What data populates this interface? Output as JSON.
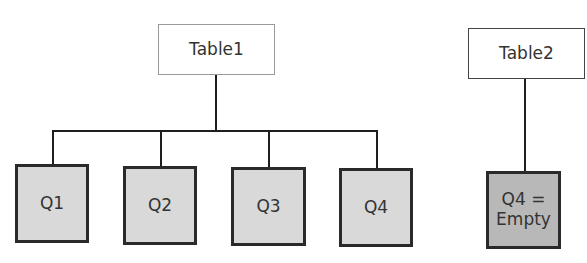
{
  "diagram": {
    "table1": {
      "label": "Table1",
      "children": [
        {
          "label": "Q1"
        },
        {
          "label": "Q2"
        },
        {
          "label": "Q3"
        },
        {
          "label": "Q4"
        }
      ]
    },
    "table2": {
      "label": "Table2",
      "children": [
        {
          "label_line1": "Q4 =",
          "label_line2": "Empty"
        }
      ]
    }
  },
  "colors": {
    "quarter_fill": "#d9d9d9",
    "empty_fill": "#b8b8b8",
    "border": "#2a2a2a",
    "table_border": "#9a9a9a"
  }
}
